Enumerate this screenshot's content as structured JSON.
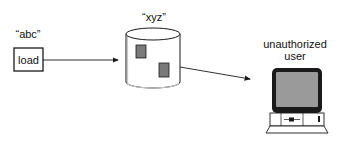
{
  "diagram": {
    "source": {
      "label": "“abc”",
      "box_text": "load"
    },
    "store": {
      "label": "“xyz”"
    },
    "actor": {
      "label_line1": "unauthorized",
      "label_line2": "user"
    },
    "colors": {
      "stroke": "#1a1a1a",
      "block_fill": "#7a7a7a",
      "screen_fill": "#9a9a9a",
      "monitor_frame": "#1a1a1a",
      "background": "#ffffff"
    }
  }
}
